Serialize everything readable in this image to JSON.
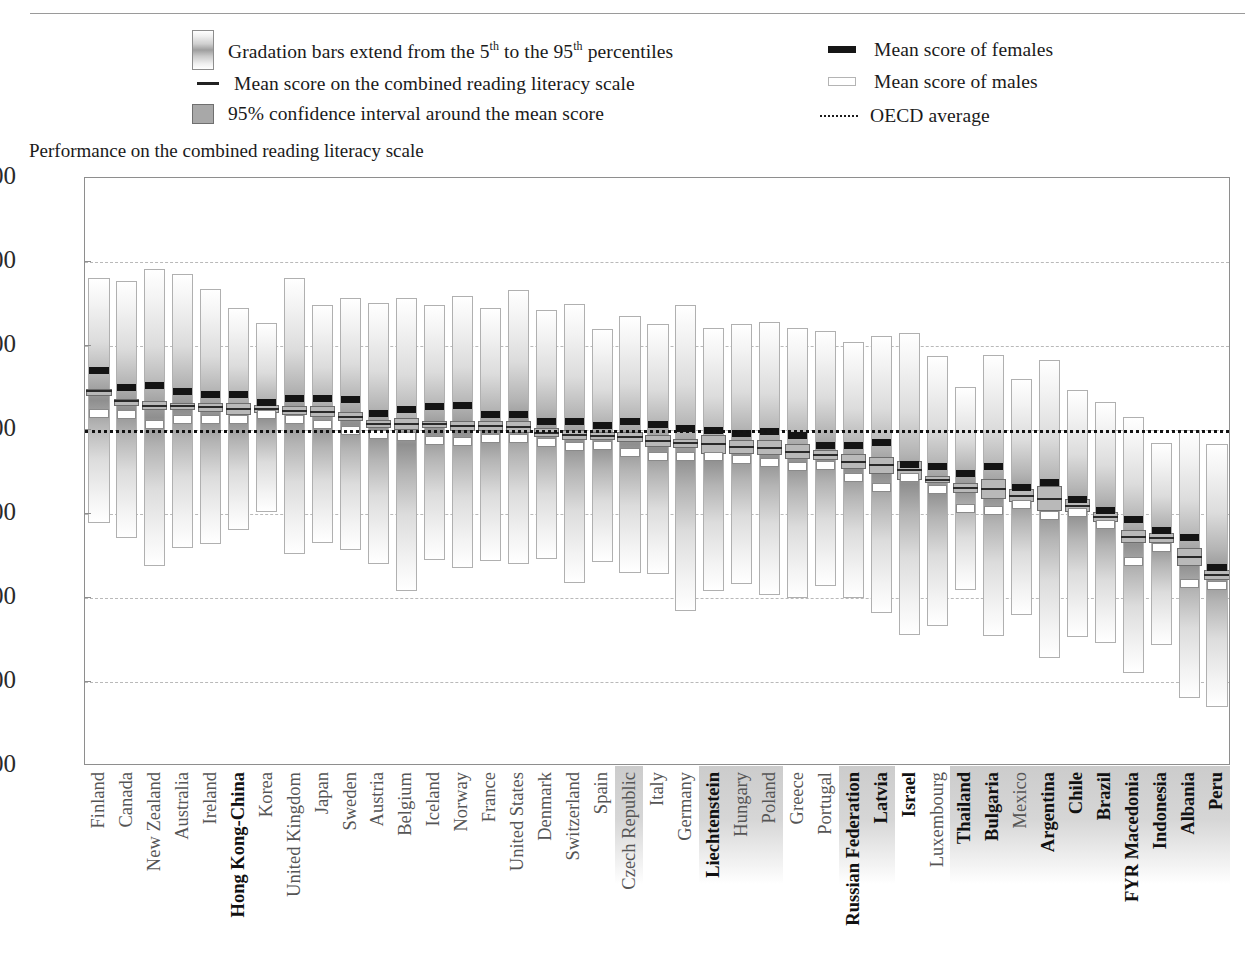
{
  "legend": {
    "gradation": "Gradation bars extend from the 5th to the 95th percentiles",
    "gradation_pre": "Gradation bars extend from the 5",
    "gradation_sup1": "th",
    "gradation_mid": " to the 95",
    "gradation_sup2": "th",
    "gradation_post": " percentiles",
    "mean_combined": "Mean score on the combined reading literacy scale",
    "confidence": "95% confidence interval around the mean score",
    "mean_females": "Mean score of females",
    "mean_males": "Mean score of males",
    "oecd_average": "OECD average"
  },
  "plot_title": "Performance on the combined reading literacy scale",
  "chart_data": {
    "type": "bar",
    "title": "Performance on the combined reading literacy scale",
    "xlabel": "",
    "ylabel": "",
    "ylim": [
      100,
      800
    ],
    "yticks": [
      100,
      200,
      300,
      400,
      500,
      600,
      700,
      800
    ],
    "grid": true,
    "legend_position": "top",
    "oecd_average": 500,
    "series_names": [
      "p5",
      "p95",
      "mean",
      "ci_low",
      "ci_high",
      "female_mean",
      "male_mean"
    ],
    "categories": [
      "Finland",
      "Canada",
      "New Zealand",
      "Australia",
      "Ireland",
      "Hong Kong-China",
      "Korea",
      "United Kingdom",
      "Japan",
      "Sweden",
      "Austria",
      "Belgium",
      "Iceland",
      "Norway",
      "France",
      "United States",
      "Denmark",
      "Switzerland",
      "Spain",
      "Czech Republic",
      "Italy",
      "Germany",
      "Liechtenstein",
      "Hungary",
      "Poland",
      "Greece",
      "Portugal",
      "Russian Federation",
      "Latvia",
      "Israel",
      "Luxembourg",
      "Thailand",
      "Bulgaria",
      "Mexico",
      "Argentina",
      "Chile",
      "Brazil",
      "FYR Macedonia",
      "Indonesia",
      "Albania",
      "Peru"
    ],
    "partner_countries": [
      "Hong Kong-China",
      "Liechtenstein",
      "Russian Federation",
      "Latvia",
      "Israel",
      "Thailand",
      "Bulgaria",
      "Argentina",
      "Brazil",
      "FYR Macedonia",
      "Indonesia",
      "Albania",
      "Peru",
      "Chile",
      "Mexico",
      "Luxembourg",
      "Czech Republic",
      "Hungary",
      "Poland",
      "Greece",
      "Portugal"
    ],
    "bold_labels": [
      "Hong Kong-China",
      "Liechtenstein",
      "Russian Federation",
      "Latvia",
      "Israel",
      "Thailand",
      "Bulgaria",
      "Argentina",
      "Chile",
      "Brazil",
      "FYR Macedonia",
      "Indonesia",
      "Albania",
      "Peru"
    ],
    "highlighted_labels": [
      "Czech Republic",
      "Liechtenstein",
      "Hungary",
      "Poland",
      "Russian Federation",
      "Latvia",
      "Thailand",
      "Bulgaria",
      "Mexico",
      "Argentina",
      "Chile",
      "Brazil",
      "FYR Macedonia",
      "Indonesia",
      "Albania",
      "Peru"
    ],
    "bars": [
      {
        "country": "Finland",
        "p5": 389,
        "p95": 681,
        "mean": 546,
        "ci_low": 543,
        "ci_high": 549,
        "female": 571,
        "male": 520
      },
      {
        "country": "Canada",
        "p5": 371,
        "p95": 677,
        "mean": 534,
        "ci_low": 531,
        "ci_high": 537,
        "female": 551,
        "male": 519
      },
      {
        "country": "New Zealand",
        "p5": 338,
        "p95": 692,
        "mean": 529,
        "ci_low": 524,
        "ci_high": 534,
        "female": 553,
        "male": 507
      },
      {
        "country": "Australia",
        "p5": 360,
        "p95": 686,
        "mean": 528,
        "ci_low": 524,
        "ci_high": 532,
        "female": 546,
        "male": 513
      },
      {
        "country": "Ireland",
        "p5": 364,
        "p95": 668,
        "mean": 527,
        "ci_low": 522,
        "ci_high": 532,
        "female": 542,
        "male": 513
      },
      {
        "country": "Hong Kong-China",
        "p5": 381,
        "p95": 645,
        "mean": 525,
        "ci_low": 518,
        "ci_high": 532,
        "female": 542,
        "male": 512
      },
      {
        "country": "Korea",
        "p5": 402,
        "p95": 627,
        "mean": 525,
        "ci_low": 520,
        "ci_high": 530,
        "female": 533,
        "male": 519
      },
      {
        "country": "United Kingdom",
        "p5": 352,
        "p95": 681,
        "mean": 523,
        "ci_low": 518,
        "ci_high": 528,
        "female": 537,
        "male": 512
      },
      {
        "country": "Japan",
        "p5": 366,
        "p95": 649,
        "mean": 522,
        "ci_low": 515,
        "ci_high": 529,
        "female": 537,
        "male": 507
      },
      {
        "country": "Sweden",
        "p5": 357,
        "p95": 657,
        "mean": 516,
        "ci_low": 511,
        "ci_high": 521,
        "female": 536,
        "male": 499
      },
      {
        "country": "Austria",
        "p5": 341,
        "p95": 651,
        "mean": 507,
        "ci_low": 502,
        "ci_high": 512,
        "female": 520,
        "male": 495
      },
      {
        "country": "Belgium",
        "p5": 308,
        "p95": 657,
        "mean": 507,
        "ci_low": 500,
        "ci_high": 514,
        "female": 525,
        "male": 492
      },
      {
        "country": "Iceland",
        "p5": 345,
        "p95": 649,
        "mean": 507,
        "ci_low": 503,
        "ci_high": 511,
        "female": 528,
        "male": 488
      },
      {
        "country": "Norway",
        "p5": 336,
        "p95": 660,
        "mean": 505,
        "ci_low": 499,
        "ci_high": 511,
        "female": 529,
        "male": 486
      },
      {
        "country": "France",
        "p5": 344,
        "p95": 645,
        "mean": 505,
        "ci_low": 499,
        "ci_high": 511,
        "female": 519,
        "male": 490
      },
      {
        "country": "United States",
        "p5": 341,
        "p95": 667,
        "mean": 504,
        "ci_low": 497,
        "ci_high": 511,
        "female": 518,
        "male": 490
      },
      {
        "country": "Denmark",
        "p5": 346,
        "p95": 643,
        "mean": 497,
        "ci_low": 492,
        "ci_high": 502,
        "female": 510,
        "male": 485
      },
      {
        "country": "Switzerland",
        "p5": 318,
        "p95": 650,
        "mean": 494,
        "ci_low": 488,
        "ci_high": 500,
        "female": 510,
        "male": 480
      },
      {
        "country": "Spain",
        "p5": 343,
        "p95": 620,
        "mean": 493,
        "ci_low": 488,
        "ci_high": 498,
        "female": 505,
        "male": 481
      },
      {
        "country": "Czech Republic",
        "p5": 330,
        "p95": 636,
        "mean": 492,
        "ci_low": 486,
        "ci_high": 498,
        "female": 510,
        "male": 473
      },
      {
        "country": "Italy",
        "p5": 329,
        "p95": 626,
        "mean": 487,
        "ci_low": 480,
        "ci_high": 494,
        "female": 507,
        "male": 469
      },
      {
        "country": "Germany",
        "p5": 284,
        "p95": 649,
        "mean": 484,
        "ci_low": 479,
        "ci_high": 489,
        "female": 502,
        "male": 468
      },
      {
        "country": "Liechtenstein",
        "p5": 308,
        "p95": 622,
        "mean": 483,
        "ci_low": 472,
        "ci_high": 494,
        "female": 500,
        "male": 468
      },
      {
        "country": "Hungary",
        "p5": 317,
        "p95": 626,
        "mean": 480,
        "ci_low": 472,
        "ci_high": 488,
        "female": 496,
        "male": 465
      },
      {
        "country": "Poland",
        "p5": 303,
        "p95": 629,
        "mean": 479,
        "ci_low": 470,
        "ci_high": 488,
        "female": 498,
        "male": 461
      },
      {
        "country": "Greece",
        "p5": 300,
        "p95": 622,
        "mean": 474,
        "ci_low": 465,
        "ci_high": 483,
        "female": 493,
        "male": 456
      },
      {
        "country": "Portugal",
        "p5": 314,
        "p95": 618,
        "mean": 470,
        "ci_low": 464,
        "ci_high": 476,
        "female": 482,
        "male": 458
      },
      {
        "country": "Russian Federation",
        "p5": 300,
        "p95": 605,
        "mean": 462,
        "ci_low": 453,
        "ci_high": 471,
        "female": 481,
        "male": 443
      },
      {
        "country": "Latvia",
        "p5": 282,
        "p95": 612,
        "mean": 458,
        "ci_low": 448,
        "ci_high": 468,
        "female": 485,
        "male": 432
      },
      {
        "country": "Israel",
        "p5": 256,
        "p95": 615,
        "mean": 452,
        "ci_low": 441,
        "ci_high": 463,
        "female": 459,
        "male": 444
      },
      {
        "country": "Luxembourg",
        "p5": 267,
        "p95": 588,
        "mean": 441,
        "ci_low": 437,
        "ci_high": 445,
        "female": 456,
        "male": 429
      },
      {
        "country": "Thailand",
        "p5": 310,
        "p95": 551,
        "mean": 431,
        "ci_low": 425,
        "ci_high": 437,
        "female": 448,
        "male": 407
      },
      {
        "country": "Bulgaria",
        "p5": 255,
        "p95": 589,
        "mean": 430,
        "ci_low": 418,
        "ci_high": 442,
        "female": 456,
        "male": 404
      },
      {
        "country": "Mexico",
        "p5": 280,
        "p95": 561,
        "mean": 422,
        "ci_low": 414,
        "ci_high": 430,
        "female": 432,
        "male": 411
      },
      {
        "country": "Argentina",
        "p5": 228,
        "p95": 583,
        "mean": 418,
        "ci_low": 403,
        "ci_high": 433,
        "female": 437,
        "male": 398
      },
      {
        "country": "Chile",
        "p5": 253,
        "p95": 548,
        "mean": 410,
        "ci_low": 402,
        "ci_high": 418,
        "female": 417,
        "male": 402
      },
      {
        "country": "Brazil",
        "p5": 247,
        "p95": 533,
        "mean": 396,
        "ci_low": 390,
        "ci_high": 402,
        "female": 404,
        "male": 388
      },
      {
        "country": "FYR Macedonia",
        "p5": 211,
        "p95": 515,
        "mean": 373,
        "ci_low": 365,
        "ci_high": 381,
        "female": 394,
        "male": 343
      },
      {
        "country": "Indonesia",
        "p5": 244,
        "p95": 485,
        "mean": 371,
        "ci_low": 365,
        "ci_high": 377,
        "female": 380,
        "male": 360
      },
      {
        "country": "Albania",
        "p5": 181,
        "p95": 500,
        "mean": 349,
        "ci_low": 338,
        "ci_high": 360,
        "female": 372,
        "male": 317
      },
      {
        "country": "Peru",
        "p5": 170,
        "p95": 483,
        "mean": 327,
        "ci_low": 321,
        "ci_high": 333,
        "female": 336,
        "male": 315
      }
    ]
  }
}
